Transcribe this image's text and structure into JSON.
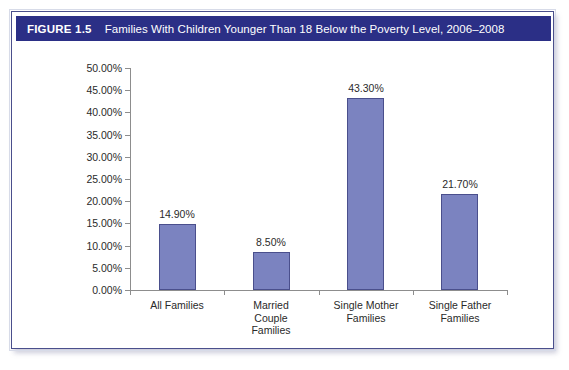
{
  "figure": {
    "number": "FIGURE 1.5",
    "title": "Families With Children Younger Than 18 Below the Poverty Level, 2006–2008",
    "titlebar_color": "#2b2f86",
    "frame_border_color": "#4a4f8c"
  },
  "chart_data": {
    "type": "bar",
    "title": "Families With Children Younger Than 18 Below the Poverty Level, 2006–2008",
    "categories": [
      "All Families",
      "Married\nCouple\nFamilies",
      "Single Mother\nFamilies",
      "Single Father\nFamilies"
    ],
    "values": [
      14.9,
      8.5,
      43.3,
      21.7
    ],
    "value_labels": [
      "14.90%",
      "8.50%",
      "43.30%",
      "21.70%"
    ],
    "xlabel": "",
    "ylabel": "",
    "ylim": [
      0,
      50
    ],
    "ytick_labels": [
      "50.00%",
      "45.00%",
      "40.00%",
      "35.00%",
      "30.00%",
      "25.00%",
      "20.00%",
      "15.00%",
      "10.00%",
      "5.00%",
      "0.00%"
    ],
    "ytick_values": [
      50,
      45,
      40,
      35,
      30,
      25,
      20,
      15,
      10,
      5,
      0
    ],
    "grid": false,
    "legend": false,
    "bar_fill_color": "#7b83c0",
    "bar_border_color": "#4a4f8c"
  }
}
